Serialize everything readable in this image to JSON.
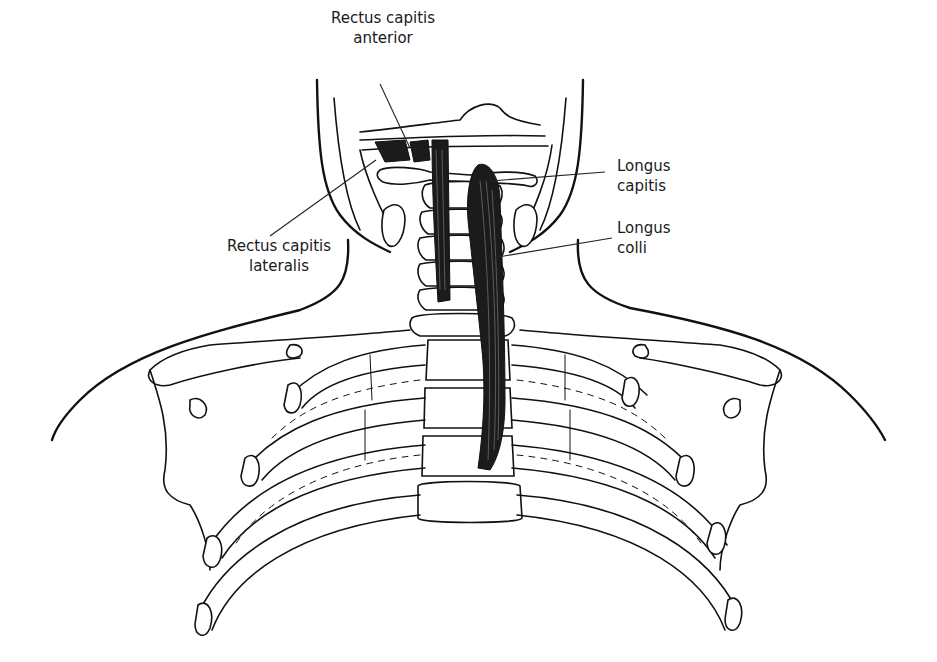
{
  "figure": {
    "type": "anatomical-line-drawing",
    "colors": {
      "background": "#ffffff",
      "line": "#111111",
      "muscle": "#1b1b1b",
      "text": "#1a1a1a"
    }
  },
  "labels": {
    "rectus_capitis_anterior": {
      "line1": "Rectus capitis",
      "line2": "anterior"
    },
    "longus_capitis": {
      "line1": "Longus",
      "line2": "capitis"
    },
    "longus_colli": {
      "line1": "Longus",
      "line2": "colli"
    },
    "rectus_capitis_lateralis": {
      "line1": "Rectus capitis",
      "line2": "lateralis"
    }
  }
}
